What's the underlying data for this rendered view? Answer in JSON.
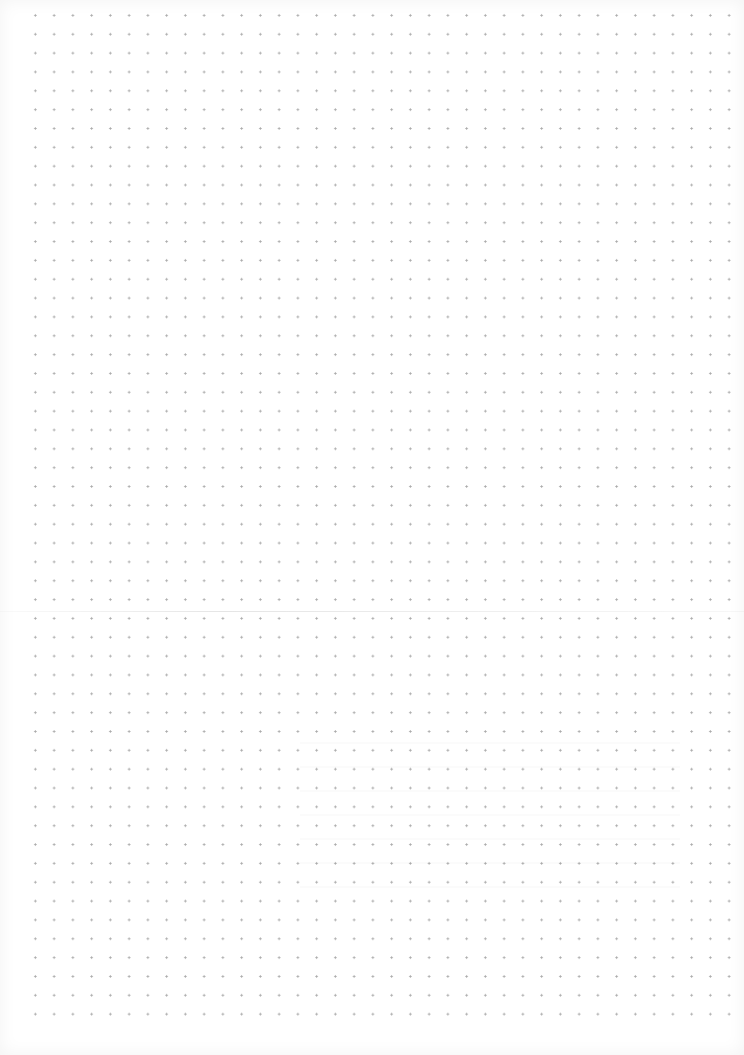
{
  "page": {
    "type": "dot-grid paper",
    "background_color": "#ffffff",
    "dot_color": "#9a9a9a",
    "grid": {
      "columns": 38,
      "rows": 54,
      "spacing_x_px": 18.75,
      "spacing_y_px": 18.85
    },
    "fold_line_y_px": 611
  }
}
